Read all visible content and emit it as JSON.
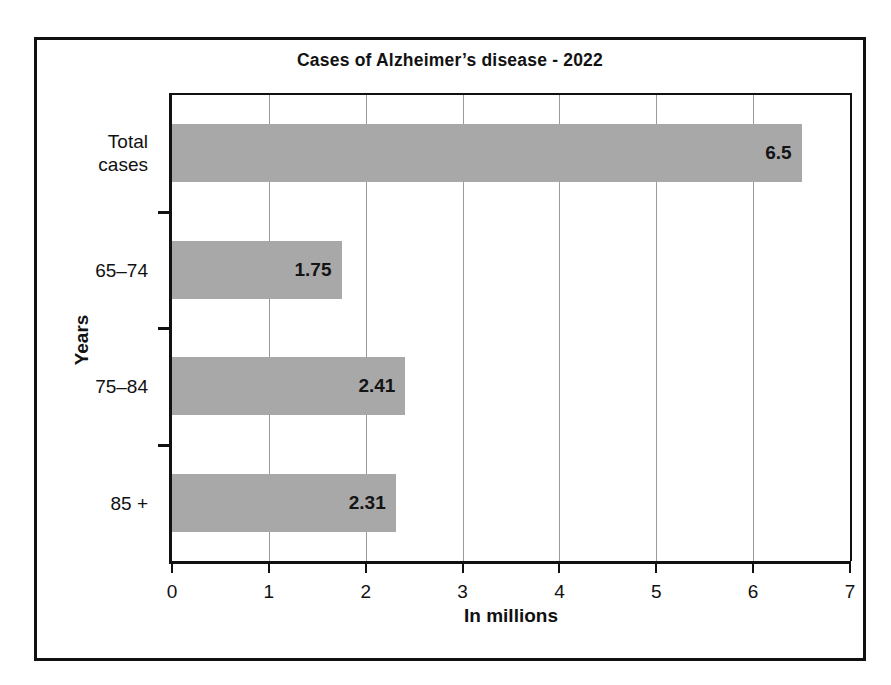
{
  "chart_data": {
    "type": "bar",
    "orientation": "horizontal",
    "title": "Cases of Alzheimer’s disease - 2022",
    "xlabel": "In millions",
    "ylabel": "Years",
    "categories": [
      "Total\ncases",
      "65–74",
      "75–84",
      "85 +"
    ],
    "values": [
      6.5,
      1.75,
      2.41,
      2.31
    ],
    "value_labels": [
      "6.5",
      "1.75",
      "2.41",
      "2.31"
    ],
    "xlim": [
      0,
      7
    ],
    "xticks": [
      0,
      1,
      2,
      3,
      4,
      5,
      6,
      7
    ],
    "xtick_labels": [
      "0",
      "1",
      "2",
      "3",
      "4",
      "5",
      "6",
      "7"
    ],
    "grid": "vertical",
    "legend": null,
    "bar_color": "#a8a8a8",
    "axis_color": "#111111",
    "gridline_color": "#9a9a9a",
    "background": "#ffffff"
  },
  "figure": {
    "frame_border_color": "#111111"
  }
}
